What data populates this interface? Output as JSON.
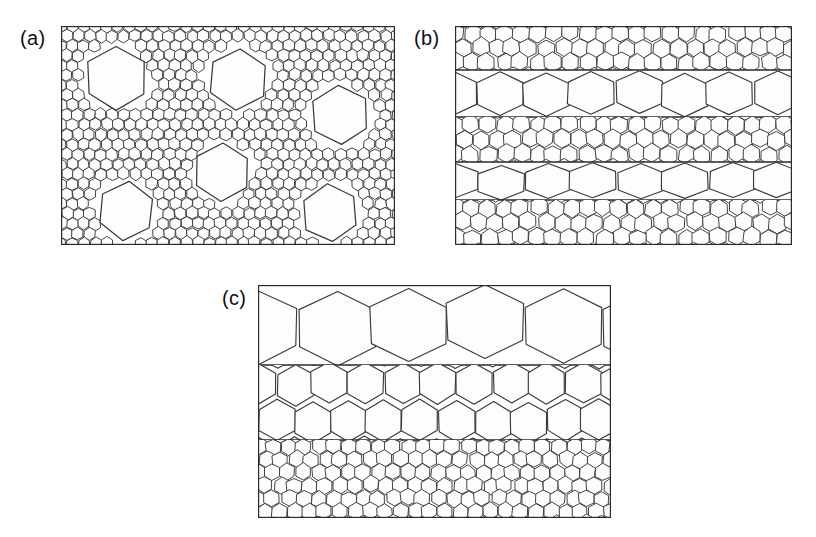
{
  "figure": {
    "background_color": "#ffffff",
    "line_color": "#3a3a3a",
    "frame_color": "#2a2a2a",
    "cell_fill": "#fdfdfd",
    "width": 816,
    "height": 537
  },
  "panels": [
    {
      "id": "a",
      "label": "(a)",
      "label_x": 20,
      "label_y": 27,
      "frame": {
        "x": 61,
        "y": 26,
        "width": 334,
        "height": 219
      },
      "pattern": "disordered-fine-matrix-with-large-bubbles",
      "matrix": {
        "cell_width": 11.4,
        "cell_rows": 20,
        "cell_cols": 31,
        "jitter": 0.17
      },
      "large_bubbles": [
        {
          "cx": 116,
          "cy": 78,
          "r": 32,
          "rot": 0
        },
        {
          "cx": 238,
          "cy": 79,
          "r": 31,
          "rot": 4
        },
        {
          "cx": 340,
          "cy": 115,
          "r": 30,
          "rot": -3
        },
        {
          "cx": 222,
          "cy": 172,
          "r": 29,
          "rot": 2
        },
        {
          "cx": 126,
          "cy": 211,
          "r": 29,
          "rot": 6
        },
        {
          "cx": 330,
          "cy": 213,
          "r": 29,
          "rot": -5
        }
      ]
    },
    {
      "id": "b",
      "label": "(b)",
      "label_x": 414,
      "label_y": 27,
      "frame": {
        "x": 455,
        "y": 26,
        "width": 337,
        "height": 219
      },
      "pattern": "alternating-coarse-fine-bands",
      "bands": [
        {
          "index": 0,
          "y": 26,
          "height": 44,
          "grain": "fine",
          "cell_width": 16.5,
          "rows": 3
        },
        {
          "index": 1,
          "y": 70,
          "height": 47,
          "grain": "coarse",
          "cell_width": 46,
          "rows": 1
        },
        {
          "index": 2,
          "y": 117,
          "height": 45,
          "grain": "fine",
          "cell_width": 16.5,
          "rows": 3
        },
        {
          "index": 3,
          "y": 162,
          "height": 38,
          "grain": "coarse",
          "cell_width": 46,
          "rows": 1
        },
        {
          "index": 4,
          "y": 200,
          "height": 45,
          "grain": "fine",
          "cell_width": 16.5,
          "rows": 3
        }
      ]
    },
    {
      "id": "c",
      "label": "(c)",
      "label_x": 222,
      "label_y": 287,
      "frame": {
        "x": 258,
        "y": 285,
        "width": 353,
        "height": 233
      },
      "pattern": "graded-coarse-to-fine-bands",
      "bands": [
        {
          "index": 0,
          "y": 285,
          "height": 80,
          "grain": "coarse",
          "cell_width": 76,
          "rows": 1
        },
        {
          "index": 1,
          "y": 365,
          "height": 75,
          "grain": "medium",
          "cell_width": 36,
          "rows": 2
        },
        {
          "index": 2,
          "y": 440,
          "height": 78,
          "grain": "fine",
          "cell_width": 15,
          "rows": 6
        }
      ]
    }
  ],
  "chart_data": {
    "type": "diagram",
    "title": "Two-dimensional hexagonal foam microstructures",
    "panel_count": 3,
    "panel_labels": [
      "(a)",
      "(b)",
      "(c)"
    ],
    "panel_descriptions": [
      "Uniform fine-grained hexagonal foam containing six isolated large hexagonal bubbles.",
      "Five alternating horizontal bands of fine and coarse hexagonal cells.",
      "Three horizontal bands graded from coarse cells at the top through medium to fine cells at the bottom."
    ],
    "cell_size_classes": {
      "fine": 15,
      "medium": 36,
      "coarse": 46,
      "very_coarse": 76,
      "large_bubble": 60
    },
    "panel_a_large_bubble_count": 6,
    "panel_b_band_count": 5,
    "panel_b_band_grain_sequence": [
      "fine",
      "coarse",
      "fine",
      "coarse",
      "fine"
    ],
    "panel_c_band_count": 3,
    "panel_c_band_grain_sequence": [
      "coarse",
      "medium",
      "fine"
    ]
  }
}
